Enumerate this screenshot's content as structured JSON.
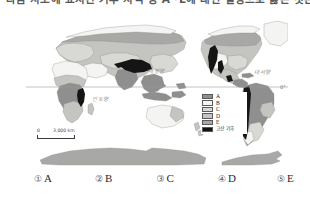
{
  "question": {
    "stem": "다음 지도에 표시된 기후 지역 중 A~E에 대한 설명으로 옳은 것은?"
  },
  "figure": {
    "map": {
      "equator_label": "0°",
      "oceans": {
        "pacific": "태평양",
        "atlantic": "대서양",
        "indian": "인도양"
      },
      "scalebar": {
        "zero": "0",
        "max": "3,000 km"
      }
    },
    "legend": {
      "items": [
        {
          "label": "A",
          "color": "#8f8f8f"
        },
        {
          "label": "B",
          "color": "#f4f4f2"
        },
        {
          "label": "C",
          "color": "#d8d8d4"
        },
        {
          "label": "D",
          "color": "#c4c4c0"
        },
        {
          "label": "E",
          "color": "#a8a8a6"
        },
        {
          "label": "고산 기후",
          "color": "#151515"
        }
      ]
    }
  },
  "choices": [
    {
      "num": "①",
      "text": "A"
    },
    {
      "num": "②",
      "text": "B"
    },
    {
      "num": "③",
      "text": "C"
    },
    {
      "num": "④",
      "text": "D"
    },
    {
      "num": "⑤",
      "text": "E"
    }
  ],
  "colors": {
    "land_base": "#b9b9b5",
    "ocean": "#ffffff",
    "outline": "#8a8a86",
    "highland": "#151515",
    "equator_line": "#9a9a9a"
  }
}
